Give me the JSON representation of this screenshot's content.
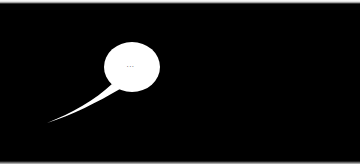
{
  "scene": {
    "background_color": "#000000",
    "bubble": {
      "text": "...",
      "fill_color": "#ffffff",
      "text_color": "#6a6a6a",
      "shape": "ellipse-speech-bubble",
      "tail_direction": "bottom-left"
    }
  }
}
